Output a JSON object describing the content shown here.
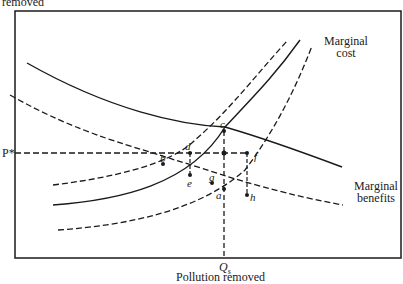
{
  "diagram": {
    "y_axis_label": "removed",
    "x_axis_label": "Pollution removed",
    "price_label": "P*",
    "quantity_label": "Q",
    "quantity_subscript": "s",
    "curves": {
      "marginal_cost": {
        "label_line1": "Marginal",
        "label_line2": "cost",
        "style": "solid with two dashed shifted versions"
      },
      "marginal_benefits": {
        "label_line1": "Marginal",
        "label_line2": "benefits",
        "style": "solid with one dashed shifted version"
      }
    },
    "points": [
      "c",
      "d",
      "b",
      "e",
      "g",
      "a",
      "f",
      "h"
    ],
    "colors": {
      "line": "#1a1a1a",
      "background": "#ffffff"
    }
  }
}
